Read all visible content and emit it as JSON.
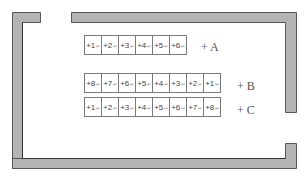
{
  "walls": {
    "fill": "#b4b4b4",
    "stroke": "#555555"
  },
  "rows": [
    {
      "label": "+ A",
      "cells": [
        "+1",
        "+2",
        "+3",
        "+4",
        "+5",
        "+6"
      ]
    },
    {
      "label": "+ B",
      "cells": [
        "+8",
        "+7",
        "+6",
        "+5",
        "+4",
        "+3",
        "+2",
        "+1"
      ]
    },
    {
      "label": "+ C",
      "cells": [
        "+1",
        "+2",
        "+3",
        "+4",
        "+5",
        "+6",
        "+7",
        "+8"
      ]
    }
  ],
  "cell_mark": "↵"
}
